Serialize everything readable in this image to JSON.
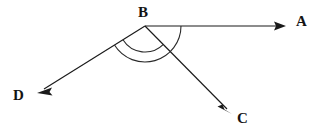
{
  "figure": {
    "background_color": "#ffffff",
    "stroke_color": "#1a1a1a",
    "width": 326,
    "height": 135
  },
  "labels": {
    "a": "A",
    "b": "B",
    "c": "C",
    "d": "D"
  },
  "geometry": {
    "vertex": {
      "name": "B",
      "x": 145,
      "y": 26
    },
    "rays": [
      {
        "name": "ray-BA",
        "from": "B",
        "to": "A",
        "start": {
          "x": 145,
          "y": 26
        },
        "end": {
          "x": 286,
          "y": 26
        },
        "arrowhead": "end",
        "direction": "right"
      },
      {
        "name": "ray-BC",
        "from": "B",
        "to": "C",
        "start": {
          "x": 145,
          "y": 26
        },
        "end": {
          "x": 232,
          "y": 114
        },
        "arrowhead": "end",
        "direction": "down-right"
      },
      {
        "name": "ray-BD",
        "from": "B",
        "to": "D",
        "start": {
          "x": 145,
          "y": 26
        },
        "end": {
          "x": 37,
          "y": 93
        },
        "arrowhead": "end",
        "direction": "down-left"
      }
    ],
    "arcs": [
      {
        "name": "angle-arc-outer",
        "center": {
          "x": 145,
          "y": 26
        },
        "radius": 36,
        "spans": "A-to-D",
        "start_angle_deg": 0,
        "end_angle_deg": 148
      },
      {
        "name": "angle-arc-inner",
        "center": {
          "x": 145,
          "y": 26
        },
        "radius": 26,
        "spans": "C-to-D",
        "start_angle_deg": 45,
        "end_angle_deg": 148
      }
    ]
  }
}
